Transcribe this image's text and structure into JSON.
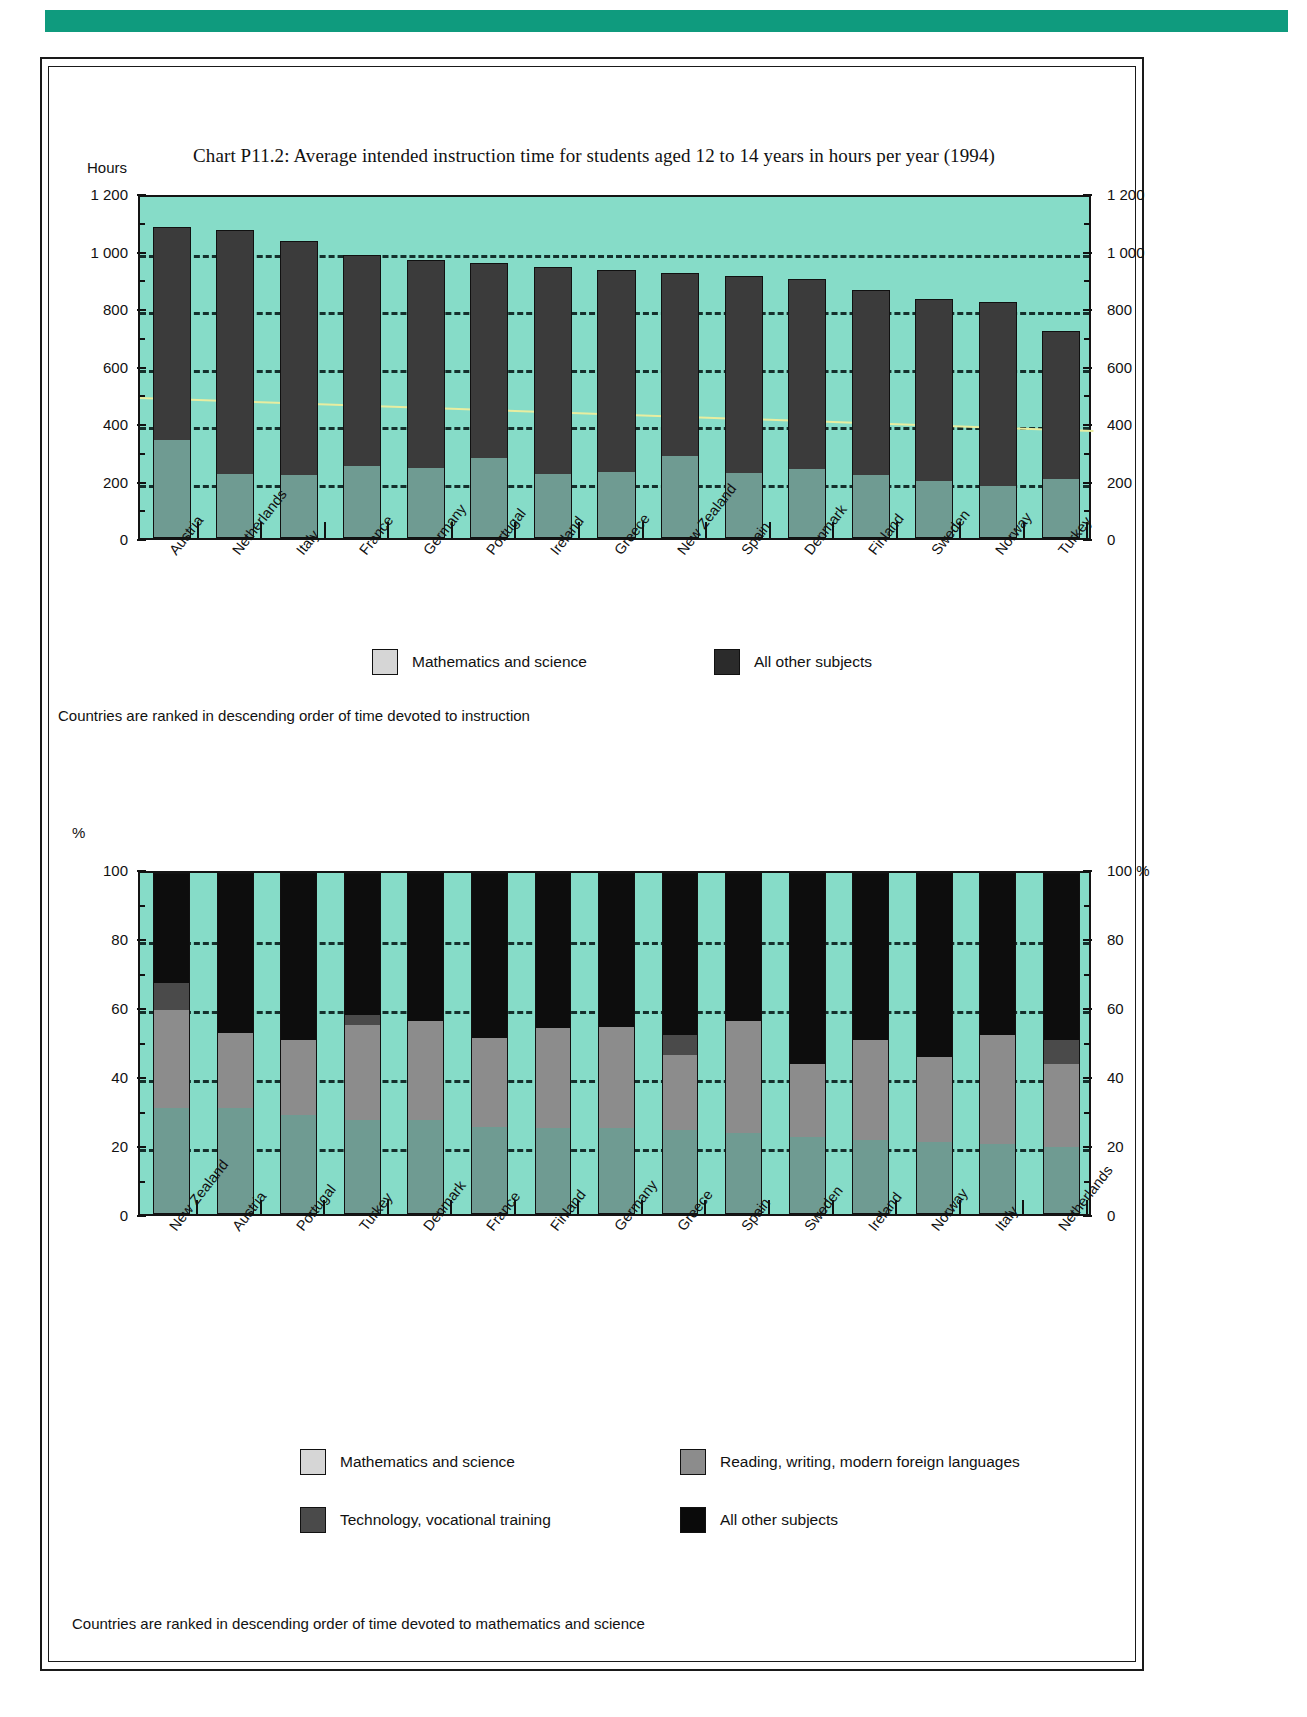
{
  "page": {
    "accent_color": "#0f9b7e",
    "plot_bg_color": "#86dcc8"
  },
  "chart_p112": {
    "title": "Chart P11.2: Average intended instruction time for students aged 12 to 14 years in hours per year (1994)",
    "unit_label": "Hours",
    "footnote": "Countries are ranked in descending order of time devoted to instruction",
    "legend": [
      {
        "label": "Mathematics and science",
        "color": "#d6d6d6"
      },
      {
        "label": "All other subjects",
        "color": "#2b2b2b"
      }
    ],
    "y_ticks_left": [
      "1 200",
      "1 000",
      "800",
      "600",
      "400",
      "200",
      "0"
    ],
    "y_ticks_right": [
      "1 200",
      "1 000",
      "800",
      "600",
      "400",
      "200",
      "0"
    ]
  },
  "chart_p113": {
    "title": "Chart P11.3: Distribution of intended instruction time for major subject areas in lower secondary education (1994)",
    "unit_label_left": "%",
    "unit_label_right": "%",
    "footnote": "Countries are ranked in descending order of time devoted to mathematics and science",
    "legend": [
      {
        "label": "Mathematics and science",
        "color": "#d6d6d6"
      },
      {
        "label": "Reading, writing, modern foreign languages",
        "color": "#8c8c8c"
      },
      {
        "label": "Technology, vocational training",
        "color": "#4a4a4a"
      },
      {
        "label": "All other subjects",
        "color": "#0a0a0a"
      }
    ],
    "y_ticks_left": [
      "100",
      "80",
      "60",
      "40",
      "20",
      "0"
    ],
    "y_ticks_right": [
      "100 %",
      "80",
      "60",
      "40",
      "20",
      "0"
    ]
  },
  "chart_data": [
    {
      "type": "bar",
      "id": "P11.2",
      "title": "Chart P11.2: Average intended instruction time for students aged 12 to 14 years in hours per year (1994)",
      "xlabel": "",
      "ylabel": "Hours",
      "ylim": [
        0,
        1200
      ],
      "yticks": [
        0,
        200,
        400,
        600,
        800,
        1000,
        1200
      ],
      "grid": true,
      "stacked": true,
      "legend_position": "bottom",
      "categories": [
        "Austria",
        "Netherlands",
        "Italy",
        "France",
        "Germany",
        "Portugal",
        "Ireland",
        "Greece",
        "New Zealand",
        "Spain",
        "Denmark",
        "Finland",
        "Sweden",
        "Norway",
        "Turkey"
      ],
      "series": [
        {
          "name": "Mathematics and science",
          "values": [
            338,
            222,
            218,
            250,
            243,
            278,
            222,
            228,
            285,
            226,
            240,
            217,
            198,
            180,
            203
          ]
        },
        {
          "name": "All other subjects",
          "values": [
            745,
            850,
            815,
            735,
            725,
            680,
            720,
            705,
            638,
            685,
            660,
            645,
            635,
            640,
            518
          ]
        }
      ],
      "totals": [
        1083,
        1072,
        1033,
        985,
        968,
        958,
        942,
        933,
        923,
        911,
        900,
        862,
        833,
        820,
        721
      ],
      "annotations": [
        {
          "type": "trendline",
          "name": "mean-line",
          "color": "#e8eda0",
          "start_value": 505,
          "end_value": 390
        }
      ]
    },
    {
      "type": "bar",
      "id": "P11.3",
      "title": "Chart P11.3: Distribution of intended instruction time for major subject areas in lower secondary education (1994)",
      "xlabel": "",
      "ylabel": "%",
      "ylim": [
        0,
        100
      ],
      "yticks": [
        0,
        20,
        40,
        60,
        80,
        100
      ],
      "grid": true,
      "stacked": true,
      "stack_total": 100,
      "legend_position": "bottom",
      "categories": [
        "New Zealand",
        "Austria",
        "Portugal",
        "Turkey",
        "Denmark",
        "France",
        "Finland",
        "Germany",
        "Greece",
        "Spain",
        "Sweden",
        "Ireland",
        "Norway",
        "Italy",
        "Netherlands"
      ],
      "series": [
        {
          "name": "Mathematics and science",
          "values": [
            31,
            31,
            29,
            27.5,
            27.5,
            25.5,
            25,
            25,
            24.5,
            23.5,
            22.5,
            21.5,
            21,
            20.5,
            19.5
          ]
        },
        {
          "name": "Reading, writing, modern foreign languages",
          "values": [
            29,
            22,
            22,
            28,
            29,
            26,
            29.5,
            30,
            22,
            33,
            21.5,
            29.5,
            25,
            32,
            24.5
          ]
        },
        {
          "name": "Technology, vocational training",
          "values": [
            8,
            0,
            0,
            3,
            0,
            0,
            0,
            0,
            6,
            0,
            0,
            0,
            0,
            0,
            7
          ]
        },
        {
          "name": "All other subjects",
          "values": [
            32,
            47,
            49,
            41.5,
            43.5,
            48.5,
            45.5,
            45,
            47.5,
            43.5,
            56,
            49,
            54,
            47.5,
            49
          ]
        }
      ]
    }
  ]
}
